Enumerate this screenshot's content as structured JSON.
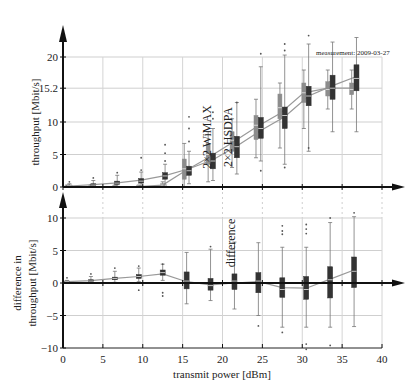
{
  "chart_data": [
    {
      "type": "box",
      "panel": "top",
      "title": "",
      "xlabel": "",
      "ylabel": "throughput [Mbit/s]",
      "xlim": [
        0,
        40
      ],
      "ylim": [
        0,
        20
      ],
      "yticks": [
        0,
        5,
        10,
        15.2,
        20
      ],
      "ytick_labels": [
        "0",
        "5",
        "10",
        "15.2",
        "20"
      ],
      "grid": true,
      "annotations": [
        {
          "text": "2×2 WiMAX",
          "x": 18.2,
          "y": 13.5,
          "rotation": -90
        },
        {
          "text": "2×2 HSDPA",
          "x": 21.0,
          "y": 13.5,
          "rotation": -90
        },
        {
          "text": "measurement: 2009-03-27",
          "x": 31.5,
          "y": 20.3
        }
      ],
      "series": [
        {
          "name": "2×2 WiMAX",
          "color": "#8c8c8c",
          "x": [
            0.5,
            3.5,
            6.5,
            9.5,
            12.5,
            15.2,
            18.2,
            21.2,
            24.2,
            27.2,
            30.2,
            33.2,
            36.2
          ],
          "median": [
            0.1,
            0.1,
            0.1,
            0.1,
            0.3,
            2.8,
            5.0,
            7.2,
            9.5,
            12.2,
            14.5,
            15.0,
            15.0
          ],
          "q1": [
            0.0,
            0.0,
            0.0,
            0.0,
            0.1,
            1.2,
            3.5,
            5.5,
            7.3,
            10.5,
            13.0,
            14.0,
            14.2
          ],
          "q3": [
            0.2,
            0.2,
            0.2,
            0.2,
            0.5,
            4.3,
            6.7,
            8.5,
            11.0,
            14.3,
            16.0,
            16.2,
            16.0
          ],
          "whisker_low": [
            0.0,
            0.0,
            0.0,
            0.0,
            0.0,
            0.0,
            0.8,
            3.0,
            4.5,
            6.0,
            9.0,
            12.0,
            12.0
          ],
          "whisker_high": [
            0.3,
            0.3,
            0.3,
            0.3,
            0.8,
            6.7,
            8.5,
            10.5,
            13.5,
            16.0,
            18.0,
            18.0,
            18.0
          ]
        },
        {
          "name": "2×2 HSDPA",
          "color": "#333333",
          "x": [
            0.8,
            3.8,
            6.8,
            9.8,
            12.8,
            15.8,
            18.8,
            21.8,
            24.8,
            27.8,
            30.8,
            33.8,
            36.8
          ],
          "median": [
            0.2,
            0.3,
            0.6,
            0.9,
            1.7,
            2.5,
            4.0,
            6.2,
            9.0,
            11.0,
            14.0,
            15.2,
            16.7
          ],
          "q1": [
            0.1,
            0.2,
            0.4,
            0.6,
            1.2,
            1.8,
            2.8,
            4.5,
            7.5,
            9.0,
            12.5,
            13.5,
            14.8
          ],
          "q3": [
            0.3,
            0.5,
            0.9,
            1.3,
            2.2,
            3.2,
            5.2,
            7.8,
            10.7,
            12.3,
            15.5,
            17.2,
            18.8
          ],
          "whisker_low": [
            0.0,
            0.0,
            0.1,
            0.2,
            0.3,
            0.5,
            1.0,
            2.0,
            4.0,
            3.5,
            5.5,
            8.5,
            8.5
          ],
          "whisker_high": [
            0.5,
            1.0,
            1.8,
            2.3,
            3.5,
            5.5,
            9.0,
            13.0,
            18.5,
            20.3,
            22.0,
            22.3,
            23.0
          ],
          "outliers_high": [
            [
              0.8,
              0.8
            ],
            [
              3.8,
              1.4
            ],
            [
              6.8,
              2.2
            ],
            [
              9.8,
              2.6
            ],
            [
              9.8,
              4.5
            ],
            [
              12.8,
              4.0
            ],
            [
              12.8,
              5.2
            ],
            [
              12.8,
              6.5
            ],
            [
              15.8,
              7.0
            ],
            [
              15.8,
              9.0
            ],
            [
              15.8,
              10.8
            ],
            [
              18.8,
              10.5
            ],
            [
              18.8,
              11.5
            ],
            [
              21.8,
              13.0
            ],
            [
              24.8,
              20.5
            ],
            [
              27.8,
              21.0
            ],
            [
              27.8,
              22.0
            ],
            [
              30.8,
              23.3
            ]
          ],
          "outliers_low": [
            [
              24.8,
              2.5
            ],
            [
              27.8,
              3.0
            ],
            [
              30.8,
              6.0
            ]
          ]
        }
      ],
      "trend_lines": [
        {
          "name": "WiMAX mean",
          "color": "#999999",
          "x": [
            0.5,
            3.5,
            6.5,
            9.5,
            12.5,
            15.2,
            18.2,
            21.2,
            24.2,
            27.2,
            30.2,
            33.2,
            36.2
          ],
          "y": [
            0.05,
            0.05,
            0.05,
            0.05,
            0.3,
            2.4,
            4.5,
            6.8,
            9.2,
            11.3,
            14.5,
            15.2,
            15.2
          ]
        },
        {
          "name": "HSDPA mean",
          "color": "#999999",
          "x": [
            0.8,
            3.8,
            6.8,
            9.8,
            12.8,
            15.8,
            18.8,
            21.8,
            24.8,
            27.8,
            30.8,
            33.8,
            36.8
          ],
          "y": [
            0.15,
            0.35,
            0.65,
            1.05,
            1.75,
            2.8,
            4.2,
            6.3,
            8.7,
            10.8,
            14.0,
            15.6,
            17.0
          ]
        }
      ]
    },
    {
      "type": "box",
      "panel": "bottom",
      "title": "",
      "xlabel": "transmit power [dBm]",
      "ylabel": "difference in throughput [Mbit/s]",
      "xlim": [
        0,
        40
      ],
      "ylim": [
        -10,
        10
      ],
      "xticks": [
        0,
        5,
        10,
        15,
        20,
        25,
        30,
        35,
        40
      ],
      "xtick_labels": [
        "0",
        "5",
        "10",
        "15",
        "20",
        "25",
        "30",
        "35",
        "40"
      ],
      "yticks": [
        -10,
        -5,
        0,
        5,
        10
      ],
      "ytick_labels": [
        "−10",
        "−5",
        "0",
        "5",
        "10"
      ],
      "grid": true,
      "annotations": [
        {
          "text": "difference",
          "x": 18.5,
          "y": 6.0,
          "rotation": -90
        }
      ],
      "series": [
        {
          "name": "difference",
          "color": "#333333",
          "x": [
            0.5,
            3.5,
            6.5,
            9.5,
            12.5,
            15.5,
            18.5,
            21.5,
            24.5,
            27.5,
            30.5,
            33.5,
            36.5
          ],
          "median": [
            0.2,
            0.3,
            0.7,
            1.0,
            1.6,
            0.3,
            -0.4,
            0.3,
            0.3,
            -1.0,
            -1.0,
            0.5,
            1.8
          ],
          "q1": [
            0.1,
            0.2,
            0.5,
            0.7,
            1.2,
            -0.9,
            -1.1,
            -1.0,
            -1.5,
            -2.2,
            -2.5,
            -2.3,
            -0.7
          ],
          "q3": [
            0.3,
            0.5,
            0.9,
            1.3,
            2.0,
            1.7,
            0.7,
            1.4,
            1.6,
            0.8,
            1.0,
            2.5,
            4.0
          ],
          "whisker_low": [
            0.0,
            0.0,
            0.1,
            0.2,
            0.4,
            -3.2,
            -2.7,
            -4.0,
            -5.0,
            -6.8,
            -6.8,
            -6.8,
            -6.7
          ],
          "whisker_high": [
            0.4,
            1.0,
            1.8,
            2.3,
            2.9,
            4.7,
            5.2,
            6.3,
            6.2,
            5.5,
            5.5,
            9.3,
            10.2
          ],
          "outliers_high": [
            [
              0.5,
              0.8
            ],
            [
              3.5,
              1.4
            ],
            [
              6.5,
              2.3
            ],
            [
              9.5,
              2.6
            ],
            [
              12.5,
              2.9
            ],
            [
              18.5,
              5.6
            ],
            [
              21.5,
              6.1
            ],
            [
              27.5,
              7.5
            ],
            [
              27.5,
              8.0
            ],
            [
              27.5,
              8.8
            ],
            [
              30.5,
              7.6
            ],
            [
              30.5,
              8.3
            ],
            [
              30.5,
              9.0
            ],
            [
              33.5,
              10.0
            ],
            [
              36.5,
              10.8
            ]
          ],
          "outliers_low": [
            [
              9.5,
              -1.1
            ],
            [
              12.5,
              -1.5
            ],
            [
              12.5,
              -2.0
            ],
            [
              24.5,
              -6.6
            ],
            [
              27.5,
              -7.6
            ],
            [
              30.5,
              -9.4
            ],
            [
              33.5,
              -9.6
            ],
            [
              30.5,
              -10.2
            ]
          ]
        }
      ],
      "trend_lines": [
        {
          "name": "difference mean",
          "color": "#999999",
          "x": [
            0.5,
            3.5,
            6.5,
            9.5,
            12.5,
            15.5,
            18.5,
            21.5,
            24.5,
            27.5,
            30.5,
            33.5,
            36.5
          ],
          "y": [
            0.2,
            0.35,
            0.7,
            1.0,
            1.4,
            0.2,
            -0.3,
            0.0,
            0.2,
            -0.7,
            -0.8,
            0.6,
            2.0
          ]
        }
      ]
    }
  ],
  "top_panel": {
    "ylabel": "throughput [Mbit/s]",
    "label_wimax": "2×2 WiMAX",
    "label_hsdpa": "2×2 HSDPA",
    "measurement": "measurement: 2009-03-27"
  },
  "bottom_panel": {
    "ylabel_line1": "difference in",
    "ylabel_line2": "throughput [Mbit/s]",
    "label_difference": "difference",
    "xlabel": "transmit power [dBm]"
  }
}
